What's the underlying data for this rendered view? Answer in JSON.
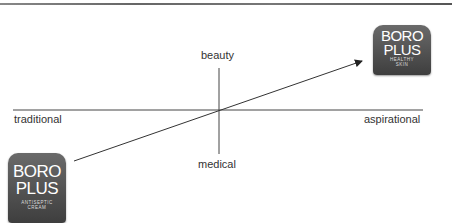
{
  "axes": {
    "top": "beauty",
    "bottom": "medical",
    "left": "traditional",
    "right": "aspirational"
  },
  "products": {
    "start": {
      "line1": "BORO",
      "line2": "PLUS",
      "tagline1": "ANTISEPTIC",
      "tagline2": "CREAM"
    },
    "end": {
      "line1": "BORO",
      "line2": "PLUS",
      "tagline1": "HEALTHY",
      "tagline2": "SKIN"
    }
  },
  "colors": {
    "line": "#333333",
    "logo": "#4a4a4a"
  }
}
